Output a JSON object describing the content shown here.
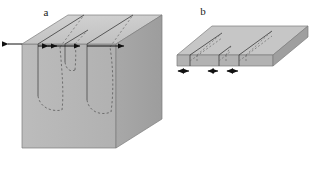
{
  "figure": {
    "type": "technical-illustration",
    "background_color": "#ffffff",
    "panels": [
      {
        "id": "a",
        "label": "a",
        "label_x": 46,
        "label_y": 16,
        "name": "thick-block-panel",
        "shape": "thick rectangular block",
        "cracks": 3,
        "crack_style": "vertical surface cracks with dashed curved crack fronts",
        "arrow_count": 4,
        "arrow_style": "horizontal spacing arrows along top front edge"
      },
      {
        "id": "b",
        "label": "b",
        "label_x": 203,
        "label_y": 15,
        "name": "thin-slab-panel",
        "shape": "thin flat slab",
        "cracks": 3,
        "crack_style": "through-thickness slots with dashed hidden edges",
        "arrow_count": 6,
        "arrow_style": "double-headed spacing arrows below front edge"
      }
    ],
    "colors": {
      "top_face": "#c9c9c9",
      "front_face": "#b6b6b6",
      "side_face": "#a3a3a3",
      "slab_top": "#c4c4c4",
      "slab_front": "#b0b0b0",
      "slab_side": "#9d9d9d",
      "outline": "#6e6e6e",
      "crack_line": "#3a3a3a",
      "dashed_crack": "#5a5a5a",
      "arrow": "#111111",
      "label_text": "#1a1a1a",
      "background": "#ffffff"
    }
  }
}
